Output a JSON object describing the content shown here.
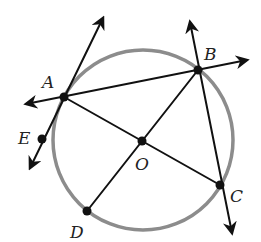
{
  "diagram": {
    "type": "circle-geometry",
    "colors": {
      "circle": "#8c8c8c",
      "lines": "#111111",
      "points": "#111111",
      "labels": "#222222"
    },
    "circle": {
      "center_label": "O",
      "cx": 143,
      "cy": 140,
      "r": 90
    },
    "points": [
      {
        "id": "A",
        "label": "A",
        "x": 64,
        "y": 97,
        "lx": 42,
        "ly": 88
      },
      {
        "id": "B",
        "label": "B",
        "x": 198,
        "y": 70,
        "lx": 204,
        "ly": 60
      },
      {
        "id": "O",
        "label": "O",
        "x": 142,
        "y": 141,
        "lx": 135,
        "ly": 170
      },
      {
        "id": "C",
        "label": "C",
        "x": 220,
        "y": 185,
        "lx": 230,
        "ly": 202
      },
      {
        "id": "D",
        "label": "D",
        "x": 87,
        "y": 211,
        "lx": 70,
        "ly": 238
      },
      {
        "id": "E",
        "label": "E",
        "x": 42,
        "y": 139,
        "lx": 18,
        "ly": 144
      }
    ],
    "lines": [
      {
        "id": "line-AB",
        "desc": "line through A and B (double arrow)",
        "x1": 26,
        "y1": 104,
        "x2": 247,
        "y2": 60
      },
      {
        "id": "line-EA",
        "desc": "line through E and A (double arrow)",
        "x1": 30,
        "y1": 168,
        "x2": 103,
        "y2": 18
      },
      {
        "id": "ray-BC",
        "desc": "line through B and C (double arrow)",
        "x1": 190,
        "y1": 22,
        "x2": 232,
        "y2": 233
      }
    ],
    "segments": [
      {
        "id": "seg-AC",
        "desc": "segment A to C through O",
        "x1": 64,
        "y1": 97,
        "x2": 220,
        "y2": 185
      },
      {
        "id": "seg-BD",
        "desc": "segment B to D through O",
        "x1": 198,
        "y1": 70,
        "x2": 87,
        "y2": 211
      }
    ]
  }
}
